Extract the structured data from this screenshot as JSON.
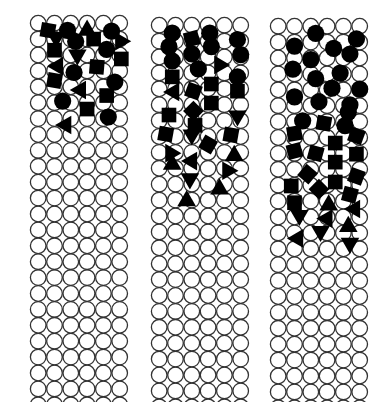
{
  "figure": {
    "background": "#ffffff",
    "circle_stroke": "#333333",
    "shape_fill": "#000000",
    "grid": {
      "cols": 6,
      "rows": 24,
      "pitch_x": 16.3,
      "pitch_y": 15.9,
      "radius": 8.2
    },
    "panels": [
      {
        "id": "panel-left",
        "x": 30,
        "y": 15,
        "shapes": [
          {
            "t": "sq",
            "c": 0.6,
            "r": 0.9,
            "a": 10
          },
          {
            "t": "ci",
            "c": 1.8,
            "r": 0.9
          },
          {
            "t": "tr",
            "c": 3.0,
            "r": 0.7,
            "a": 0
          },
          {
            "t": "ci",
            "c": 4.5,
            "r": 1.0
          },
          {
            "t": "tr",
            "c": 1.1,
            "r": 2.0,
            "a": 180
          },
          {
            "t": "ci",
            "c": 2.3,
            "r": 2.3
          },
          {
            "t": "sq",
            "c": 3.4,
            "r": 2.0,
            "a": 0
          },
          {
            "t": "tr",
            "c": 5.0,
            "r": 2.1,
            "a": -30
          },
          {
            "t": "sq",
            "c": 1.0,
            "r": 3.4,
            "a": 0
          },
          {
            "t": "ci",
            "c": 4.2,
            "r": 3.3
          },
          {
            "t": "tr",
            "c": 2.4,
            "r": 4.2,
            "a": 180
          },
          {
            "t": "sq",
            "c": 5.1,
            "r": 4.5,
            "a": 0
          },
          {
            "t": "tr",
            "c": 1.1,
            "r": 5.4,
            "a": -90
          },
          {
            "t": "sq",
            "c": 3.6,
            "r": 5.5,
            "a": 5
          },
          {
            "t": "ci",
            "c": 2.2,
            "r": 6.2
          },
          {
            "t": "sq",
            "c": 1.0,
            "r": 7.2,
            "a": 10
          },
          {
            "t": "ci",
            "c": 4.7,
            "r": 7.4
          },
          {
            "t": "tr",
            "c": 2.5,
            "r": 8.4,
            "a": -90
          },
          {
            "t": "sq",
            "c": 4.2,
            "r": 9.1,
            "a": 0
          },
          {
            "t": "ci",
            "c": 1.5,
            "r": 9.8
          },
          {
            "t": "sq",
            "c": 3.0,
            "r": 10.8,
            "a": 0
          },
          {
            "t": "ci",
            "c": 4.3,
            "r": 11.8
          },
          {
            "t": "tr",
            "c": 1.6,
            "r": 12.8,
            "a": -90
          }
        ]
      },
      {
        "id": "panel-middle",
        "x": 151,
        "y": 17,
        "shapes": [
          {
            "t": "ci",
            "c": 0.8,
            "r": 1.0
          },
          {
            "t": "ci",
            "c": 3.1,
            "r": 1.0
          },
          {
            "t": "sq",
            "c": 2.0,
            "r": 1.7,
            "a": -15
          },
          {
            "t": "ci",
            "c": 4.8,
            "r": 1.8
          },
          {
            "t": "ci",
            "c": 0.6,
            "r": 2.7
          },
          {
            "t": "ci",
            "c": 3.2,
            "r": 2.7
          },
          {
            "t": "ci",
            "c": 2.0,
            "r": 3.6
          },
          {
            "t": "ci",
            "c": 5.0,
            "r": 3.7
          },
          {
            "t": "ci",
            "c": 0.8,
            "r": 4.5
          },
          {
            "t": "tr",
            "c": 3.8,
            "r": 5.0,
            "a": 90
          },
          {
            "t": "ci",
            "c": 2.4,
            "r": 5.5
          },
          {
            "t": "sq",
            "c": 0.8,
            "r": 6.5,
            "a": 0
          },
          {
            "t": "ci",
            "c": 4.8,
            "r": 6.5
          },
          {
            "t": "sq",
            "c": 3.2,
            "r": 7.4,
            "a": 0
          },
          {
            "t": "tr",
            "c": 0.8,
            "r": 8.4,
            "a": -90
          },
          {
            "t": "sq",
            "c": 2.1,
            "r": 8.3,
            "a": 20
          },
          {
            "t": "sq",
            "c": 4.8,
            "r": 8.3,
            "a": 0
          },
          {
            "t": "sq",
            "c": 3.2,
            "r": 9.8,
            "a": 0
          },
          {
            "t": "sq",
            "c": 2.1,
            "r": 10.8,
            "a": 45
          },
          {
            "t": "sq",
            "c": 0.6,
            "r": 11.3,
            "a": 0
          },
          {
            "t": "tr",
            "c": 4.8,
            "r": 11.6,
            "a": 180
          },
          {
            "t": "sq",
            "c": 2.2,
            "r": 12.6,
            "a": 0
          },
          {
            "t": "sq",
            "c": 0.4,
            "r": 13.7,
            "a": 10
          },
          {
            "t": "tr",
            "c": 2.0,
            "r": 14.0,
            "a": 180
          },
          {
            "t": "sq",
            "c": 4.4,
            "r": 13.8,
            "a": 10
          },
          {
            "t": "sq",
            "c": 3.0,
            "r": 15.0,
            "a": 30
          },
          {
            "t": "tr",
            "c": 0.8,
            "r": 16.1,
            "a": 90
          },
          {
            "t": "tr",
            "c": 4.6,
            "r": 16.2,
            "a": 0
          },
          {
            "t": "tr",
            "c": 1.9,
            "r": 17.1,
            "a": -90
          },
          {
            "t": "tr",
            "c": 0.8,
            "r": 17.3,
            "a": 0
          },
          {
            "t": "tr",
            "c": 4.3,
            "r": 18.3,
            "a": 90
          },
          {
            "t": "tr",
            "c": 1.8,
            "r": 19.2,
            "a": -60
          },
          {
            "t": "tr",
            "c": 3.7,
            "r": 20.4,
            "a": 0
          },
          {
            "t": "tr",
            "c": 1.6,
            "r": 22.2,
            "a": -120
          }
        ]
      },
      {
        "id": "panel-right",
        "x": 270,
        "y": 18,
        "shapes": [
          {
            "t": "ci",
            "c": 2.3,
            "r": 0.9
          },
          {
            "t": "ci",
            "c": 4.8,
            "r": 1.6
          },
          {
            "t": "ci",
            "c": 1.0,
            "r": 2.5
          },
          {
            "t": "ci",
            "c": 3.4,
            "r": 2.8
          },
          {
            "t": "ci",
            "c": 4.4,
            "r": 3.5
          },
          {
            "t": "ci",
            "c": 2.0,
            "r": 4.2
          },
          {
            "t": "ci",
            "c": 0.9,
            "r": 5.4
          },
          {
            "t": "ci",
            "c": 3.8,
            "r": 5.9
          },
          {
            "t": "ci",
            "c": 2.3,
            "r": 6.6
          },
          {
            "t": "ci",
            "c": 3.3,
            "r": 7.8
          },
          {
            "t": "ci",
            "c": 5.0,
            "r": 7.9
          },
          {
            "t": "ci",
            "c": 1.0,
            "r": 8.9
          },
          {
            "t": "ci",
            "c": 2.5,
            "r": 9.5
          },
          {
            "t": "ci",
            "c": 4.4,
            "r": 9.9
          },
          {
            "t": "ci",
            "c": 4.3,
            "r": 10.8
          },
          {
            "t": "ci",
            "c": 1.5,
            "r": 11.9
          },
          {
            "t": "sq",
            "c": 2.8,
            "r": 12.2,
            "a": 10
          },
          {
            "t": "ci",
            "c": 4.1,
            "r": 12.5
          },
          {
            "t": "sq",
            "c": 1.0,
            "r": 13.5,
            "a": -10
          },
          {
            "t": "sq",
            "c": 4.8,
            "r": 13.8,
            "a": 20
          },
          {
            "t": "sq",
            "c": 3.5,
            "r": 14.7,
            "a": 0
          },
          {
            "t": "sq",
            "c": 1.0,
            "r": 15.7,
            "a": -15
          },
          {
            "t": "sq",
            "c": 2.3,
            "r": 16.0,
            "a": 15
          },
          {
            "t": "sq",
            "c": 4.8,
            "r": 16.1,
            "a": 0
          },
          {
            "t": "sq",
            "c": 3.5,
            "r": 17.1,
            "a": 0
          },
          {
            "t": "sq",
            "c": 1.8,
            "r": 18.6,
            "a": 40
          },
          {
            "t": "sq",
            "c": 4.8,
            "r": 18.9,
            "a": 20
          },
          {
            "t": "sq",
            "c": 3.5,
            "r": 19.6,
            "a": 0
          },
          {
            "t": "sq",
            "c": 0.8,
            "r": 20.1,
            "a": 0
          },
          {
            "t": "sq",
            "c": 2.5,
            "r": 20.5,
            "a": 45
          },
          {
            "t": "sq",
            "c": 4.4,
            "r": 21.2,
            "a": 15
          },
          {
            "t": "sq",
            "c": 1.0,
            "r": 22.2,
            "a": 0
          },
          {
            "t": "tr",
            "c": 3.1,
            "r": 22.3,
            "a": 0
          },
          {
            "t": "tr",
            "c": 4.6,
            "r": 23.0,
            "a": -90
          },
          {
            "t": "tr",
            "c": 1.3,
            "r": 24.0,
            "a": 180
          },
          {
            "t": "tr",
            "c": 2.9,
            "r": 24.2,
            "a": -90
          },
          {
            "t": "tr",
            "c": 4.3,
            "r": 25.0,
            "a": 0
          },
          {
            "t": "tr",
            "c": 2.6,
            "r": 26.0,
            "a": 180
          },
          {
            "t": "tr",
            "c": 1.1,
            "r": 26.7,
            "a": -90
          },
          {
            "t": "tr",
            "c": 4.4,
            "r": 27.5,
            "a": 180
          }
        ]
      }
    ]
  }
}
